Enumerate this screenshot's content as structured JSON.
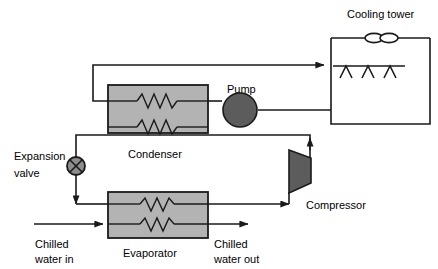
{
  "diagram": {
    "title_visible": false,
    "type": "chiller-cooling-tower-schematic",
    "labels": {
      "cooling_tower": "Cooling tower",
      "pump": "Pump",
      "condenser": "Condenser",
      "expansion_valve_line1": "Expansion",
      "expansion_valve_line2": "valve",
      "compressor": "Compressor",
      "evaporator": "Evaporator",
      "chilled_water_in_line1": "Chilled",
      "chilled_water_in_line2": "water in",
      "chilled_water_out_line1": "Chilled",
      "chilled_water_out_line2": "water out"
    },
    "components": [
      {
        "name": "cooling-tower",
        "label": "Cooling tower",
        "shape": "rectangle-open",
        "fill": "#ffffff"
      },
      {
        "name": "cooling-tower-fan",
        "label": "",
        "shape": "double-ellipse",
        "fill": "#ffffff"
      },
      {
        "name": "cooling-tower-spray-nozzles",
        "label": "",
        "shape": "three-chevrons",
        "count": 3
      },
      {
        "name": "pump",
        "label": "Pump",
        "shape": "circle",
        "fill": "#5c5c5c"
      },
      {
        "name": "condenser",
        "label": "Condenser",
        "shape": "rectangle",
        "fill": "#b3b3b3",
        "coils": 2
      },
      {
        "name": "expansion-valve",
        "label": "Expansion valve",
        "shape": "circle-with-x",
        "fill": "#8c8c8c"
      },
      {
        "name": "compressor",
        "label": "Compressor",
        "shape": "trapezoid",
        "fill": "#5c5c5c"
      },
      {
        "name": "evaporator",
        "label": "Evaporator",
        "shape": "rectangle",
        "fill": "#b3b3b3",
        "coils": 2
      }
    ],
    "colors": {
      "line": "#1a1a1a",
      "heat_exchanger_fill": "#b3b3b3",
      "pump_fill": "#5c5c5c",
      "compressor_fill": "#5c5c5c",
      "valve_fill": "#8c8c8c",
      "background": "#ffffff"
    }
  }
}
